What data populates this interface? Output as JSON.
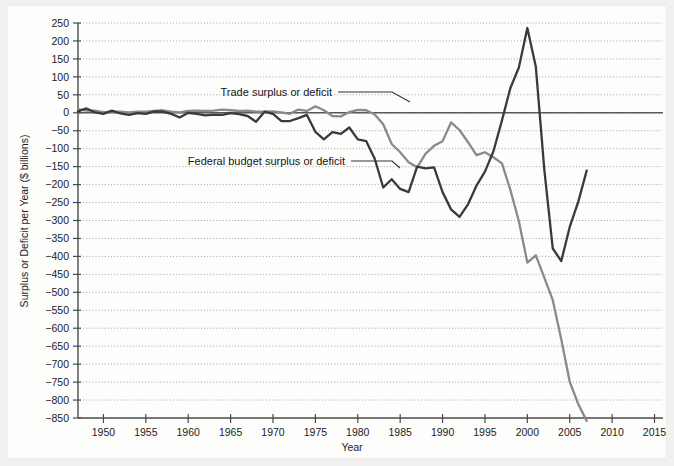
{
  "figure": {
    "background_color": "#f2f1ef",
    "paper_color": "#fdfdfc",
    "x_axis_title": "Year",
    "y_axis_title": "Surplus or Deficit per Year ($ billions)"
  },
  "annotations": {
    "trade_label": "Trade surplus or deficit",
    "budget_label": "Federal budget surplus or deficit"
  },
  "chart_data": {
    "type": "line",
    "title": "",
    "subtitle": "",
    "xlabel": "Year",
    "ylabel": "Surplus or Deficit per Year ($ billions)",
    "xlim": [
      1947,
      2016
    ],
    "ylim": [
      -850,
      250
    ],
    "xticks": [
      1950,
      1955,
      1960,
      1965,
      1970,
      1975,
      1980,
      1985,
      1990,
      1995,
      2000,
      2005,
      2010,
      2015
    ],
    "yticks": [
      250,
      200,
      150,
      100,
      50,
      0,
      -50,
      -100,
      -150,
      -200,
      -250,
      -300,
      -350,
      -400,
      -450,
      -500,
      -550,
      -600,
      -650,
      -700,
      -750,
      -800,
      -850
    ],
    "grid": true,
    "grid_axis": "y",
    "legend_position": "inline-annotations",
    "zero_reference_line": 0,
    "colors": {
      "trade": "#8a8a8a",
      "budget": "#3a3a3a",
      "grid": "#9a9a9a",
      "axis": "#4a4a4a"
    },
    "series": [
      {
        "name": "Trade surplus or deficit",
        "color": "#8a8a8a",
        "x": [
          1947,
          1948,
          1949,
          1950,
          1951,
          1952,
          1953,
          1954,
          1955,
          1956,
          1957,
          1958,
          1959,
          1960,
          1961,
          1962,
          1963,
          1964,
          1965,
          1966,
          1967,
          1968,
          1969,
          1970,
          1971,
          1972,
          1973,
          1974,
          1975,
          1976,
          1977,
          1978,
          1979,
          1980,
          1981,
          1982,
          1983,
          1984,
          1985,
          1986,
          1987,
          1988,
          1989,
          1990,
          1991,
          1992,
          1993,
          1994,
          1995,
          1996,
          1997,
          1998,
          1999,
          2000,
          2001,
          2002,
          2003,
          2004,
          2005,
          2006,
          2007
        ],
        "values": [
          10,
          6,
          6,
          2,
          3,
          3,
          1,
          3,
          3,
          5,
          7,
          3,
          1,
          5,
          6,
          5,
          6,
          9,
          7,
          5,
          6,
          3,
          3,
          4,
          1,
          -3,
          9,
          5,
          18,
          7,
          -9,
          -10,
          2,
          8,
          7,
          -5,
          -32,
          -87,
          -110,
          -138,
          -152,
          -114,
          -92,
          -79,
          -27,
          -48,
          -82,
          -118,
          -110,
          -124,
          -141,
          -215,
          -302,
          -417,
          -397,
          -459,
          -522,
          -631,
          -749,
          -811,
          -858
        ]
      },
      {
        "name": "Federal budget surplus or deficit",
        "color": "#3a3a3a",
        "x": [
          1947,
          1948,
          1949,
          1950,
          1951,
          1952,
          1953,
          1954,
          1955,
          1956,
          1957,
          1958,
          1959,
          1960,
          1961,
          1962,
          1963,
          1964,
          1965,
          1966,
          1967,
          1968,
          1969,
          1970,
          1971,
          1972,
          1973,
          1974,
          1975,
          1976,
          1977,
          1978,
          1979,
          1980,
          1981,
          1982,
          1983,
          1984,
          1985,
          1986,
          1987,
          1988,
          1989,
          1990,
          1991,
          1992,
          1993,
          1994,
          1995,
          1996,
          1997,
          1998,
          1999,
          2000,
          2001,
          2002,
          2003,
          2004,
          2005,
          2006,
          2007
        ],
        "values": [
          4,
          12,
          1,
          -3,
          6,
          -2,
          -6,
          -1,
          -3,
          4,
          3,
          -3,
          -13,
          0,
          -3,
          -7,
          -5,
          -6,
          -1,
          -4,
          -9,
          -25,
          3,
          -3,
          -23,
          -23,
          -15,
          -6,
          -53,
          -74,
          -54,
          -59,
          -41,
          -74,
          -79,
          -128,
          -208,
          -185,
          -212,
          -221,
          -150,
          -155,
          -152,
          -221,
          -269,
          -290,
          -255,
          -203,
          -164,
          -107,
          -22,
          69,
          126,
          236,
          128,
          -158,
          -378,
          -413,
          -318,
          -248,
          -161
        ]
      }
    ]
  }
}
